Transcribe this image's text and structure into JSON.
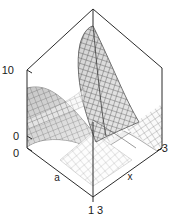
{
  "figure": {
    "name": "3d-surface-plot",
    "background": "#ffffff",
    "line_color": "#2b2b2b",
    "text_color": "#1a1a1a",
    "width": 178,
    "height": 222
  },
  "axes": {
    "z": {
      "name": "z-axis",
      "ticks": [
        {
          "label": "10",
          "x": 14,
          "y": 74
        },
        {
          "label": "0",
          "x": 19,
          "y": 140
        }
      ]
    },
    "a": {
      "name": "a-axis",
      "title": "a",
      "title_x": 57,
      "title_y": 181,
      "ticks": [
        {
          "label": "0",
          "x": 19,
          "y": 157
        },
        {
          "label": "1",
          "x": 90,
          "y": 213
        }
      ]
    },
    "x": {
      "name": "x-axis",
      "title": "x",
      "title_x": 130,
      "title_y": 180,
      "ticks": [
        {
          "label": "3",
          "x": 99,
          "y": 213
        },
        {
          "label": "-3",
          "x": 158,
          "y": 152
        }
      ]
    }
  },
  "box": {
    "name": "bounding-box",
    "top_apex": {
      "x": 93,
      "y": 9
    },
    "left_corner": {
      "x": 27,
      "y": 70
    },
    "right_corner": {
      "x": 162,
      "y": 68
    },
    "front_vertex": {
      "x": 93,
      "y": 197
    },
    "left_bottom": {
      "x": 27,
      "y": 148
    },
    "right_bottom": {
      "x": 162,
      "y": 148
    }
  },
  "chart_data": {
    "type": "surface",
    "title": "",
    "xlabel": "x",
    "ylabel": "a",
    "zlabel": "",
    "xlim": [
      3,
      -3
    ],
    "ylim": [
      0,
      1
    ],
    "zlim": [
      0,
      10
    ],
    "grid": false,
    "legend": "none",
    "projection": "3d-wireframe-box",
    "mesh": {
      "style": "wireframe-with-shading",
      "grid_lines_u": 24,
      "grid_lines_v": 24,
      "line_color": "#303030",
      "fill_light": "#f2f2f2",
      "fill_mid": "#b8b8b8",
      "fill_dark": "#6f6f6f"
    },
    "features": [
      {
        "name": "central-peak",
        "description": "tall dark mesh ridge rising toward the back of the box, apex near z = 10",
        "approx_peak_z": 10
      },
      {
        "name": "left-fold",
        "description": "shaded grey fold sloping down from upper-left toward the front-left baseline"
      },
      {
        "name": "right-sheet",
        "description": "lighter mesh sheet sloping down to the right and curving up at the far right edge"
      },
      {
        "name": "front-valley",
        "description": "low pale valley near the front vertex where a = 1, z approaches 0"
      }
    ],
    "z_ticks": [
      0,
      10
    ],
    "a_ticks": [
      0,
      1
    ],
    "x_ticks": [
      3,
      -3
    ]
  }
}
